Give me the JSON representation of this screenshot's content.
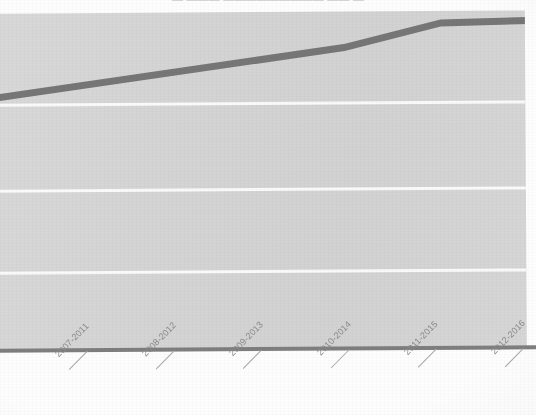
{
  "chart_data": {
    "type": "line",
    "title": "",
    "title_note": "title cropped off at top edge, illegible",
    "xlabel": "",
    "ylabel": "",
    "categories": [
      "2007-2011",
      "2008-2012",
      "2009-2013",
      "2010-2014",
      "2011-2015",
      "2012-2016"
    ],
    "series": [
      {
        "name": "trend",
        "values": [
          74,
          78,
          82,
          86,
          93,
          94
        ],
        "color": "#767676"
      }
    ],
    "ylim": [
      0,
      100
    ],
    "grid": "horizontal white gridlines, no y tick labels visible",
    "legend": "none",
    "plot_background": "#d4d4d4",
    "axis_color": "#7e7e7e",
    "gridline_color": "#fafafa",
    "gridline_positions_px": [
      102,
      188,
      270
    ],
    "vertices_px": [
      {
        "x": 0,
        "y": 96
      },
      {
        "x": 345,
        "y": 48
      },
      {
        "x": 442,
        "y": 24
      },
      {
        "x": 530,
        "y": 22
      }
    ]
  },
  "title_strip": {
    "text": "▬  ▬▬▬  ▬▬▬▬▬▬▬▬▬  ▬▬  ▬"
  },
  "axis": {
    "ticks": [
      {
        "label": "2007-2011",
        "x": 88
      },
      {
        "label": "2008-2012",
        "x": 175
      },
      {
        "label": "2009-2013",
        "x": 262
      },
      {
        "label": "2010-2014",
        "x": 350
      },
      {
        "label": "2011-2015",
        "x": 437
      },
      {
        "label": "2012-2016",
        "x": 524
      }
    ]
  }
}
